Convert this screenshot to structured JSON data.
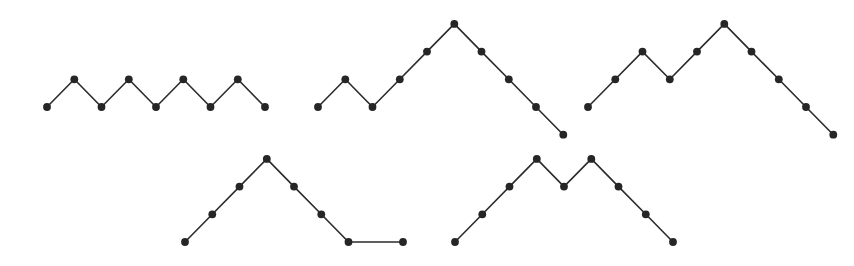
{
  "figure": {
    "background_color": "#ffffff",
    "line_color": "#2b2b2b",
    "dot_color": "#262626",
    "dot_radius": 3.9,
    "line_width": 1.6,
    "step_width": 27.3,
    "step_height": 27.7,
    "rows": [
      {
        "name": "top-row",
        "baseline_y": 107,
        "path_count": 3
      },
      {
        "name": "bottom-row",
        "baseline_y": 242,
        "path_count": 2
      }
    ]
  },
  "chart_data": {
    "type": "line",
    "xlabel": "",
    "ylabel": "",
    "grid": false,
    "legend": "none",
    "series": [
      {
        "name": "path-1",
        "row": "top-row",
        "steps": "UDUDUDUD",
        "step_count": 8,
        "vertex_count": 9,
        "start_x": 47,
        "baseline_y": 107,
        "heights": [
          0,
          1,
          0,
          1,
          0,
          1,
          0,
          1,
          0
        ],
        "x": [
          47,
          74.3,
          101.5,
          128.8,
          156,
          183.3,
          210.5,
          237.8,
          265
        ],
        "y": [
          107,
          79.3,
          107,
          79.3,
          107,
          79.3,
          107,
          79.3,
          107
        ]
      },
      {
        "name": "path-2",
        "row": "top-row",
        "steps": "UDUUUDDDD",
        "step_count": 9,
        "vertex_count": 10,
        "start_x": 318,
        "baseline_y": 107,
        "heights": [
          0,
          1,
          0,
          1,
          2,
          3,
          2,
          1,
          0,
          -1
        ],
        "x": [
          318,
          345.3,
          372.5,
          399.8,
          427,
          454.3,
          481.5,
          508.8,
          536,
          563.3
        ],
        "y": [
          107,
          79.3,
          107,
          79.3,
          51.6,
          23.9,
          51.6,
          79.3,
          107,
          134.7
        ]
      },
      {
        "name": "path-3",
        "row": "top-row",
        "steps": "UUDUUDDDD",
        "step_count": 9,
        "vertex_count": 10,
        "start_x": 588,
        "baseline_y": 107,
        "heights": [
          0,
          1,
          2,
          1,
          2,
          3,
          2,
          1,
          0,
          -1
        ],
        "x": [
          588,
          615.3,
          642.5,
          669.8,
          697,
          724.3,
          751.5,
          778.8,
          806,
          833.3
        ],
        "y": [
          107,
          79.3,
          51.6,
          79.3,
          51.6,
          23.9,
          51.6,
          79.3,
          107,
          134.7
        ]
      },
      {
        "name": "path-4",
        "row": "bottom-row",
        "steps": "UUUDDDDUD",
        "step_count": 9,
        "vertex_count": 10,
        "start_x": 185,
        "baseline_y": 242,
        "heights": [
          0,
          1,
          2,
          3,
          2,
          1,
          0,
          -1,
          0,
          -1
        ],
        "x": [
          185,
          212.3,
          239.5,
          266.8,
          294,
          321.3,
          348.5,
          375.8,
          403,
          430.3
        ],
        "y": [
          242,
          214.3,
          186.6,
          158.9,
          186.6,
          214.3,
          242,
          269.7,
          242,
          269.7
        ]
      },
      {
        "name": "path-5",
        "row": "bottom-row",
        "steps": "UUUDUDDDD",
        "step_count": 9,
        "vertex_count": 10,
        "start_x": 455,
        "baseline_y": 242,
        "heights": [
          0,
          1,
          2,
          3,
          2,
          3,
          2,
          1,
          0,
          -1
        ],
        "x": [
          455,
          482.3,
          509.5,
          536.8,
          564,
          591.3,
          618.5,
          645.8,
          673,
          700.3
        ],
        "y": [
          242,
          214.3,
          186.6,
          158.9,
          186.6,
          158.9,
          186.6,
          214.3,
          242,
          269.7
        ]
      }
    ]
  }
}
